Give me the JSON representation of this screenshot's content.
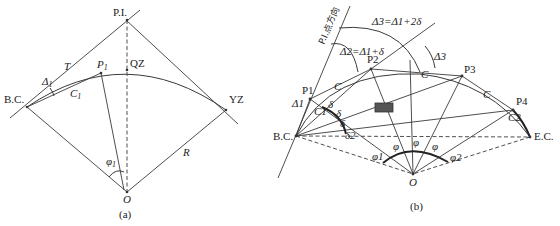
{
  "diagram_a": {
    "caption": "(a)",
    "labels": {
      "pi": "P.I.",
      "qz": "QZ",
      "bc": "B.C.",
      "yz": "YZ",
      "p1": "P",
      "p1_sub": "1",
      "t": "T",
      "delta1": "Δ",
      "delta1_sub": "1",
      "c1": "C",
      "c1_sub": "1",
      "r": "R",
      "o": "O",
      "phi1": "φ",
      "phi1_sub": "1"
    }
  },
  "diagram_b": {
    "caption": "(b)",
    "labels": {
      "pi_direction": "P.I.点方向",
      "delta3_eq": "Δ3=Δ1+2δ",
      "delta2_eq": "Δ2=Δ1+δ",
      "delta3": "Δ3",
      "delta1": "Δ1",
      "delta2": "δ2",
      "p1": "P1",
      "p2": "P2",
      "p3": "P3",
      "p4": "P4",
      "c": "C",
      "c1": "C1",
      "c2": "C2",
      "bc": "B.C.",
      "ec": "E.C.",
      "o": "O",
      "delta": "δ",
      "phi": "φ",
      "phi1": "φ1",
      "phi2": "φ2"
    }
  }
}
